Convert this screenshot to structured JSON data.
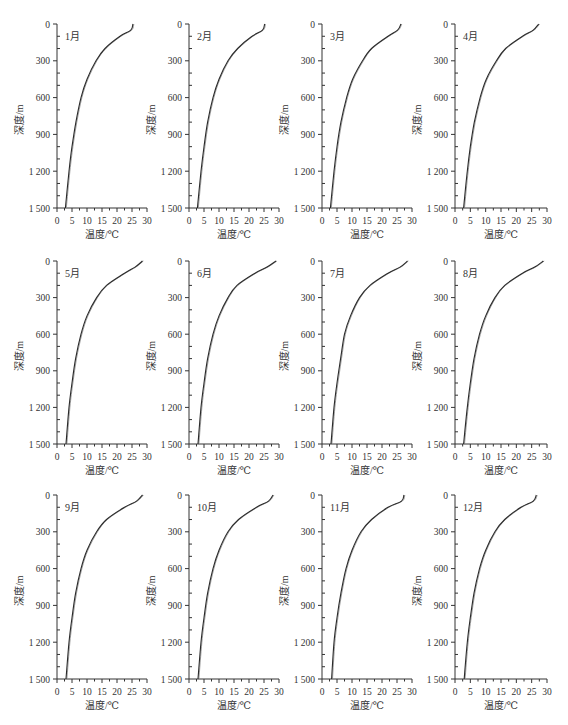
{
  "figure": {
    "layout": {
      "rows": 3,
      "cols": 4
    },
    "axis_color": "#333333",
    "line_color": "#2a2a2a"
  },
  "chart_data": [
    {
      "type": "line",
      "title": "1月",
      "xlabel": "温度/℃",
      "ylabel": "深度/m",
      "xlim": [
        0,
        30
      ],
      "ylim": [
        1500,
        0
      ],
      "y_inverted": true,
      "xticks": [
        "0",
        "5",
        "10",
        "15",
        "20",
        "25",
        "30"
      ],
      "yticks": [
        "0",
        "300",
        "600",
        "900",
        "1 200",
        "1 500"
      ],
      "series": [
        {
          "name": "温度",
          "x": [
            25.3,
            24.6,
            21.0,
            16.0,
            13.0,
            10.0,
            8.0,
            6.3,
            5.0,
            4.0,
            2.8
          ],
          "y": [
            0,
            50,
            100,
            200,
            300,
            450,
            600,
            800,
            1000,
            1200,
            1500
          ]
        }
      ]
    },
    {
      "type": "line",
      "title": "2月",
      "xlabel": "温度/℃",
      "ylabel": "深度/m",
      "xlim": [
        0,
        30
      ],
      "ylim": [
        1500,
        0
      ],
      "y_inverted": true,
      "xticks": [
        "0",
        "5",
        "10",
        "15",
        "20",
        "25",
        "30"
      ],
      "yticks": [
        "0",
        "300",
        "600",
        "900",
        "1 200",
        "1 500"
      ],
      "series": [
        {
          "name": "温度",
          "x": [
            25.2,
            24.5,
            21.0,
            16.2,
            13.0,
            10.0,
            8.0,
            6.2,
            5.0,
            4.0,
            2.8
          ],
          "y": [
            0,
            50,
            100,
            200,
            300,
            450,
            600,
            800,
            1000,
            1200,
            1500
          ]
        }
      ]
    },
    {
      "type": "line",
      "title": "3月",
      "xlabel": "温度/℃",
      "ylabel": "深度/m",
      "xlim": [
        0,
        30
      ],
      "ylim": [
        1500,
        0
      ],
      "y_inverted": true,
      "xticks": [
        "0",
        "5",
        "10",
        "15",
        "20",
        "25",
        "30"
      ],
      "yticks": [
        "0",
        "300",
        "600",
        "900",
        "1 200",
        "1 500"
      ],
      "series": [
        {
          "name": "温度",
          "x": [
            26.3,
            25.2,
            22.0,
            16.5,
            13.5,
            10.2,
            8.2,
            6.3,
            5.0,
            4.0,
            2.8
          ],
          "y": [
            0,
            50,
            100,
            200,
            300,
            450,
            600,
            800,
            1000,
            1200,
            1500
          ]
        }
      ]
    },
    {
      "type": "line",
      "title": "4月",
      "xlabel": "温度/℃",
      "ylabel": "深度/m",
      "xlim": [
        0,
        30
      ],
      "ylim": [
        1500,
        0
      ],
      "y_inverted": true,
      "xticks": [
        "0",
        "5",
        "10",
        "15",
        "20",
        "25",
        "30"
      ],
      "yticks": [
        "0",
        "300",
        "600",
        "900",
        "1 200",
        "1 500"
      ],
      "series": [
        {
          "name": "温度",
          "x": [
            27.3,
            25.5,
            22.0,
            16.5,
            13.5,
            10.2,
            8.2,
            6.3,
            5.0,
            4.0,
            2.8
          ],
          "y": [
            0,
            50,
            100,
            200,
            300,
            450,
            600,
            800,
            1000,
            1200,
            1500
          ]
        }
      ]
    },
    {
      "type": "line",
      "title": "5月",
      "xlabel": "温度/℃",
      "ylabel": "深度/m",
      "xlim": [
        0,
        30
      ],
      "ylim": [
        1500,
        0
      ],
      "y_inverted": true,
      "xticks": [
        "0",
        "5",
        "10",
        "15",
        "20",
        "25",
        "30"
      ],
      "yticks": [
        "0",
        "300",
        "600",
        "900",
        "1 200",
        "1 500"
      ],
      "series": [
        {
          "name": "温度",
          "x": [
            28.5,
            26.0,
            22.5,
            16.5,
            13.2,
            10.0,
            8.0,
            6.2,
            5.0,
            4.0,
            3.0
          ],
          "y": [
            0,
            50,
            100,
            200,
            300,
            450,
            600,
            800,
            1000,
            1200,
            1500
          ]
        }
      ]
    },
    {
      "type": "line",
      "title": "6月",
      "xlabel": "温度/℃",
      "ylabel": "深度/m",
      "xlim": [
        0,
        30
      ],
      "ylim": [
        1500,
        0
      ],
      "y_inverted": true,
      "xticks": [
        "0",
        "5",
        "10",
        "15",
        "20",
        "25",
        "30"
      ],
      "yticks": [
        "0",
        "300",
        "600",
        "900",
        "1 200",
        "1 500"
      ],
      "series": [
        {
          "name": "温度",
          "x": [
            29.0,
            26.0,
            22.0,
            16.0,
            13.0,
            10.0,
            8.0,
            6.2,
            5.0,
            4.0,
            3.0
          ],
          "y": [
            0,
            50,
            100,
            200,
            300,
            450,
            600,
            800,
            1000,
            1200,
            1500
          ]
        }
      ]
    },
    {
      "type": "line",
      "title": "7月",
      "xlabel": "温度/℃",
      "ylabel": "深度/m",
      "xlim": [
        0,
        30
      ],
      "ylim": [
        1500,
        0
      ],
      "y_inverted": true,
      "xticks": [
        "0",
        "5",
        "10",
        "15",
        "20",
        "25",
        "30"
      ],
      "yticks": [
        "0",
        "300",
        "600",
        "900",
        "1 200",
        "1 500"
      ],
      "series": [
        {
          "name": "温度",
          "x": [
            28.5,
            26.0,
            22.0,
            16.0,
            12.5,
            9.5,
            7.5,
            6.2,
            5.0,
            4.0,
            3.0
          ],
          "y": [
            0,
            50,
            100,
            200,
            300,
            450,
            600,
            800,
            1000,
            1200,
            1500
          ]
        }
      ]
    },
    {
      "type": "line",
      "title": "8月",
      "xlabel": "温度/℃",
      "ylabel": "深度/m",
      "xlim": [
        0,
        30
      ],
      "ylim": [
        1500,
        0
      ],
      "y_inverted": true,
      "xticks": [
        "0",
        "5",
        "10",
        "15",
        "20",
        "25",
        "30"
      ],
      "yticks": [
        "0",
        "300",
        "600",
        "900",
        "1 200",
        "1 500"
      ],
      "series": [
        {
          "name": "温度",
          "x": [
            28.8,
            26.0,
            22.0,
            16.2,
            13.0,
            10.0,
            8.0,
            6.2,
            5.0,
            4.0,
            2.8
          ],
          "y": [
            0,
            50,
            100,
            200,
            300,
            450,
            600,
            800,
            1000,
            1200,
            1500
          ]
        }
      ]
    },
    {
      "type": "line",
      "title": "9月",
      "xlabel": "温度/℃",
      "ylabel": "深度/m",
      "xlim": [
        0,
        30
      ],
      "ylim": [
        1500,
        0
      ],
      "y_inverted": true,
      "xticks": [
        "0",
        "5",
        "10",
        "15",
        "20",
        "25",
        "30"
      ],
      "yticks": [
        "0",
        "300",
        "600",
        "900",
        "1 200",
        "1 500"
      ],
      "series": [
        {
          "name": "温度",
          "x": [
            28.5,
            26.5,
            22.5,
            16.5,
            13.2,
            10.0,
            8.0,
            6.2,
            5.0,
            4.0,
            3.0
          ],
          "y": [
            0,
            50,
            100,
            200,
            300,
            450,
            600,
            800,
            1000,
            1200,
            1500
          ]
        }
      ]
    },
    {
      "type": "line",
      "title": "10月",
      "xlabel": "温度/℃",
      "ylabel": "深度/m",
      "xlim": [
        0,
        30
      ],
      "ylim": [
        1500,
        0
      ],
      "y_inverted": true,
      "xticks": [
        "0",
        "5",
        "10",
        "15",
        "20",
        "25",
        "30"
      ],
      "yticks": [
        "0",
        "300",
        "600",
        "900",
        "1 200",
        "1 500"
      ],
      "series": [
        {
          "name": "温度",
          "x": [
            28.0,
            26.5,
            22.5,
            16.5,
            13.0,
            10.0,
            8.0,
            6.2,
            5.0,
            4.0,
            3.0
          ],
          "y": [
            0,
            50,
            100,
            200,
            300,
            450,
            600,
            800,
            1000,
            1200,
            1500
          ]
        }
      ]
    },
    {
      "type": "line",
      "title": "11月",
      "xlabel": "温度/℃",
      "ylabel": "深度/m",
      "xlim": [
        0,
        30
      ],
      "ylim": [
        1500,
        0
      ],
      "y_inverted": true,
      "xticks": [
        "0",
        "5",
        "10",
        "15",
        "20",
        "25",
        "30"
      ],
      "yticks": [
        "0",
        "300",
        "600",
        "900",
        "1 200",
        "1 500"
      ],
      "series": [
        {
          "name": "温度",
          "x": [
            27.3,
            26.5,
            22.0,
            16.5,
            13.0,
            10.0,
            8.0,
            6.3,
            5.0,
            4.0,
            3.2
          ],
          "y": [
            0,
            50,
            100,
            200,
            300,
            450,
            600,
            800,
            1000,
            1200,
            1500
          ]
        }
      ]
    },
    {
      "type": "line",
      "title": "12月",
      "xlabel": "温度/℃",
      "ylabel": "深度/m",
      "xlim": [
        0,
        30
      ],
      "ylim": [
        1500,
        0
      ],
      "y_inverted": true,
      "xticks": [
        "0",
        "5",
        "10",
        "15",
        "20",
        "25",
        "30"
      ],
      "yticks": [
        "0",
        "300",
        "600",
        "900",
        "1 200",
        "1 500"
      ],
      "series": [
        {
          "name": "温度",
          "x": [
            26.5,
            25.5,
            21.5,
            16.2,
            13.0,
            10.0,
            8.0,
            6.2,
            5.0,
            4.0,
            3.0
          ],
          "y": [
            0,
            50,
            100,
            200,
            300,
            450,
            600,
            800,
            1000,
            1200,
            1500
          ]
        }
      ]
    }
  ]
}
